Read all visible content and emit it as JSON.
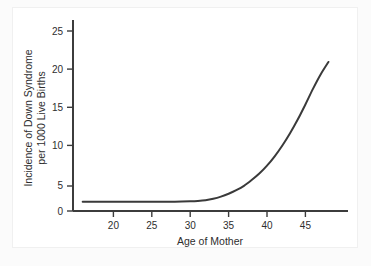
{
  "figure": {
    "background_color": "#fbfbfb",
    "panel_color": "#ffffff",
    "line_color": "#3a3a3a",
    "axis_color": "#3c3c3c",
    "text_color": "#2e2e2e"
  },
  "chart_data": {
    "type": "line",
    "title": "",
    "xlabel": "Age of Mother",
    "ylabel": "Incidence of Down Syndrome per 1000 Live Births",
    "ylabel_line1": "Incidence of Down Syndrome",
    "ylabel_line2": "per 1000 Live Births",
    "xlim": [
      16,
      51
    ],
    "ylim": [
      0,
      28
    ],
    "xticks": [
      20,
      25,
      30,
      35,
      40,
      45
    ],
    "xtick_labels": [
      "20",
      "25",
      "30",
      "35",
      "40",
      "45"
    ],
    "yticks": [
      0,
      5,
      10,
      15,
      20,
      25
    ],
    "ytick_labels": [
      "0",
      "5",
      "10",
      "15",
      "20",
      "25"
    ],
    "grid": false,
    "legend": null,
    "series": [
      {
        "name": "Incidence of Down Syndrome per 1000 Live Births",
        "color": "#3a3a3a",
        "x": [
          16,
          18,
          20,
          22,
          24,
          26,
          28,
          30,
          31,
          32,
          33,
          34,
          35,
          36,
          37,
          38,
          39,
          40,
          41,
          42,
          43,
          44,
          45,
          46,
          47,
          48
        ],
        "y": [
          1.3,
          1.3,
          1.3,
          1.3,
          1.3,
          1.3,
          1.3,
          1.35,
          1.4,
          1.5,
          1.7,
          2.0,
          2.4,
          2.9,
          3.5,
          4.3,
          5.2,
          6.3,
          7.6,
          9.1,
          10.8,
          12.7,
          14.8,
          17.0,
          19.0,
          20.7
        ]
      }
    ]
  }
}
